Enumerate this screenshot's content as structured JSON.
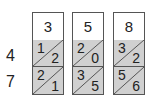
{
  "diagram": {
    "type": "lattice-multiplication",
    "top_digits": [
      "3",
      "5",
      "8"
    ],
    "side_digits": [
      "4",
      "7"
    ],
    "cells": [
      [
        {
          "tens": "1",
          "ones": "2"
        },
        {
          "tens": "2",
          "ones": "0"
        },
        {
          "tens": "3",
          "ones": "2"
        }
      ],
      [
        {
          "tens": "2",
          "ones": "1"
        },
        {
          "tens": "3",
          "ones": "5"
        },
        {
          "tens": "5",
          "ones": "6"
        }
      ]
    ],
    "colors": {
      "cell_fill": "#d0d0d0",
      "border": "#555555",
      "header_fill": "#ffffff"
    }
  }
}
